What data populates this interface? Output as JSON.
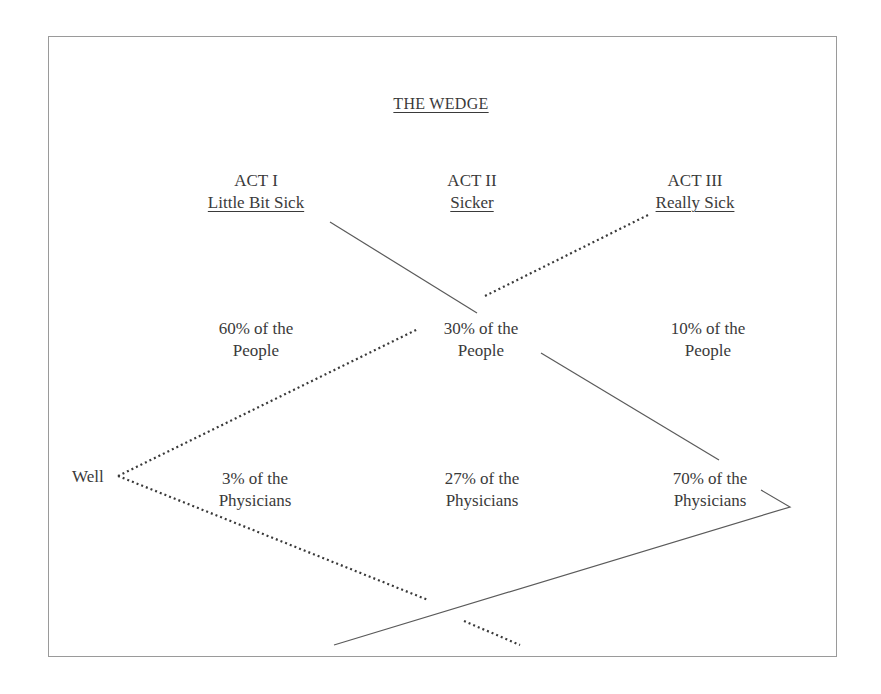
{
  "title": "THE WEDGE",
  "acts": [
    {
      "act": "ACT I",
      "label": "Little Bit Sick"
    },
    {
      "act": "ACT II",
      "label": "Sicker"
    },
    {
      "act": "ACT III",
      "label": "Really Sick"
    }
  ],
  "people": [
    {
      "line1": "60% of the",
      "line2": "People"
    },
    {
      "line1": "30% of the",
      "line2": "People"
    },
    {
      "line1": "10% of the",
      "line2": "People"
    }
  ],
  "physicians": [
    {
      "line1": "3% of the",
      "line2": "Physicians"
    },
    {
      "line1": "27% of the",
      "line2": "Physicians"
    },
    {
      "line1": "70% of the",
      "line2": "Physicians"
    }
  ],
  "start_label": "Well",
  "colors": {
    "text": "#3a3a3a",
    "line": "#5a5a5a",
    "frame": "#9a9a9a"
  }
}
